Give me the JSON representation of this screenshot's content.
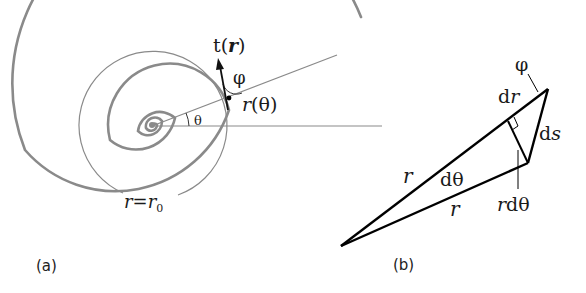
{
  "figure": {
    "panel_a": {
      "label": "(a)",
      "tangent_label_prefix": "t(",
      "tangent_label_var": "r",
      "tangent_label_suffix": ")",
      "phi_label": "φ",
      "r_theta_var": "r",
      "r_theta_arg": "(θ)",
      "theta_label": "θ",
      "r0_var": "r",
      "r0_eq": "=",
      "r0_sub_var": "r",
      "r0_subscript": "0"
    },
    "panel_b": {
      "label": "(b)",
      "phi_label": "φ",
      "dr_d": "d",
      "dr_var": "r",
      "ds_d": "d",
      "ds_var": "s",
      "r_upper": "r",
      "r_lower": "r",
      "dtheta": "dθ",
      "rdtheta_var": "r",
      "rdtheta_rest": "dθ"
    },
    "colors": {
      "spiral": "#8a8a8a",
      "circle": "#8a8a8a",
      "guide_lines": "#8a8a8a",
      "triangle": "#000000",
      "text": "#1a1a1a"
    }
  }
}
